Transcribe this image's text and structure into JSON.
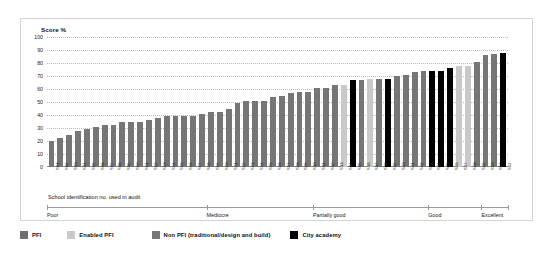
{
  "chart_data": {
    "type": "bar",
    "title": "Score %",
    "xlabel": "School identification no. used in audit",
    "ylabel": "Score %",
    "ylim": [
      0,
      100
    ],
    "yticks": [
      0,
      10,
      20,
      30,
      40,
      50,
      60,
      70,
      80,
      90,
      100
    ],
    "grid": true,
    "legend_position": "bottom",
    "categories": [
      "S01",
      "S02",
      "S03",
      "S04",
      "S05",
      "S06",
      "S07",
      "S08",
      "S09",
      "S10",
      "S11",
      "S12",
      "S13",
      "S14",
      "S15",
      "S16",
      "S17",
      "S18",
      "S19",
      "S20",
      "S21",
      "S22",
      "S23",
      "S24",
      "S25",
      "S26",
      "S27",
      "S28",
      "S29",
      "S30",
      "S31",
      "S32",
      "S33",
      "S34",
      "S35",
      "S36",
      "S37",
      "S38",
      "S39",
      "S40",
      "S41",
      "S42",
      "S43",
      "S44",
      "S45",
      "S46",
      "S47",
      "S48",
      "S49",
      "S50",
      "S51",
      "S52"
    ],
    "values": [
      20,
      22,
      25,
      28,
      29,
      31,
      32,
      32,
      35,
      35,
      35,
      36,
      38,
      39,
      39,
      39,
      39,
      41,
      42,
      42,
      45,
      49,
      51,
      51,
      51,
      54,
      55,
      57,
      58,
      58,
      61,
      61,
      63,
      63,
      67,
      67,
      68,
      68,
      68,
      70,
      71,
      73,
      74,
      74,
      74,
      76,
      78,
      78,
      81,
      86,
      87,
      88
    ],
    "point_types": [
      "non_pfi",
      "non_pfi",
      "non_pfi",
      "non_pfi",
      "non_pfi",
      "non_pfi",
      "non_pfi",
      "non_pfi",
      "non_pfi",
      "non_pfi",
      "non_pfi",
      "non_pfi",
      "non_pfi",
      "non_pfi",
      "non_pfi",
      "non_pfi",
      "non_pfi",
      "non_pfi",
      "non_pfi",
      "non_pfi",
      "non_pfi",
      "non_pfi",
      "non_pfi",
      "non_pfi",
      "non_pfi",
      "non_pfi",
      "non_pfi",
      "non_pfi",
      "non_pfi",
      "non_pfi",
      "non_pfi",
      "non_pfi",
      "non_pfi",
      "enabled_pfi",
      "city_academy",
      "non_pfi",
      "enabled_pfi",
      "non_pfi",
      "city_academy",
      "non_pfi",
      "non_pfi",
      "non_pfi",
      "non_pfi",
      "city_academy",
      "city_academy",
      "city_academy",
      "enabled_pfi",
      "enabled_pfi",
      "non_pfi",
      "non_pfi",
      "non_pfi",
      "city_academy"
    ],
    "bands": [
      {
        "label": "Poor",
        "start_index": 0,
        "end_index": 17
      },
      {
        "label": "Mediocre",
        "start_index": 18,
        "end_index": 29
      },
      {
        "label": "Partially good",
        "start_index": 30,
        "end_index": 42
      },
      {
        "label": "Good",
        "start_index": 43,
        "end_index": 48
      },
      {
        "label": "Excellent",
        "start_index": 49,
        "end_index": 51
      }
    ],
    "series_legend": [
      {
        "key": "pfi",
        "label": "PFI",
        "color": "#6e6e6e"
      },
      {
        "key": "enabled_pfi",
        "label": "Enabled PFI",
        "color": "#c9c9c9"
      },
      {
        "key": "non_pfi",
        "label": "Non PFI (traditional/design and build)",
        "color": "#767676"
      },
      {
        "key": "city_academy",
        "label": "City academy",
        "color": "#000000"
      }
    ]
  },
  "colors": {
    "pfi": "#6e6e6e",
    "enabled_pfi": "#c9c9c9",
    "non_pfi": "#767676",
    "city_academy": "#000000",
    "grid": "#b9b9b9",
    "axis": "#8c8c8c",
    "frame": "#d3d3d3",
    "text": "#111111",
    "background": "#ffffff"
  }
}
